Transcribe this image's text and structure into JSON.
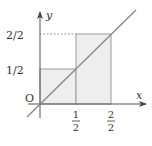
{
  "diagram": {
    "type": "step-function-with-line",
    "axes": {
      "x_label": "x",
      "y_label": "y",
      "origin_label": "O"
    },
    "x_ticks": [
      {
        "num": "1",
        "den": "2"
      },
      {
        "num": "2",
        "den": "2"
      }
    ],
    "y_ticks": [
      {
        "label": "1/2"
      },
      {
        "label": "2/2"
      }
    ],
    "rectangles": [
      {
        "x_from": "0",
        "x_to": "1/2",
        "height": "1/2"
      },
      {
        "x_from": "1/2",
        "x_to": "2/2",
        "height": "2/2"
      }
    ],
    "line": "y = x",
    "colors": {
      "axis": "#555555",
      "line": "#8a8a8a",
      "fill": "#eeeeee",
      "rect_stroke": "#9a9a9a",
      "text": "#333333"
    }
  }
}
